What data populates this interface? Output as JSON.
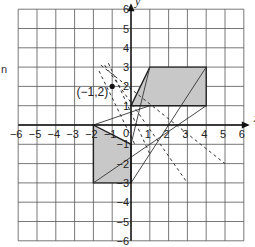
{
  "diagram": {
    "type": "coordinate-grid-transformation",
    "x_axis_label": "x",
    "y_axis_label": "y",
    "x_range": [
      -6,
      6
    ],
    "y_range": [
      -6,
      6
    ],
    "x_ticks": [
      "-6",
      "-5",
      "-4",
      "-3",
      "-2",
      "-1",
      "0",
      "1",
      "2",
      "3",
      "4",
      "5",
      "6"
    ],
    "y_ticks": [
      "6",
      "5",
      "4",
      "3",
      "2",
      "1",
      "-1",
      "-2",
      "-3",
      "-4",
      "-5",
      "-6"
    ],
    "origin_label": "0",
    "center_point": {
      "label": "(−1,2)",
      "x": -1,
      "y": 2
    },
    "shape_upper": {
      "name": "parallelogram",
      "vertices": [
        [
          0,
          1
        ],
        [
          1,
          3
        ],
        [
          4,
          3
        ],
        [
          4,
          1
        ]
      ],
      "fill": "#c8c8c8"
    },
    "shape_lower": {
      "name": "quadrilateral",
      "vertices": [
        [
          -2,
          0
        ],
        [
          0,
          -1
        ],
        [
          0,
          -3
        ],
        [
          -2,
          -3
        ]
      ],
      "fill": "#c8c8c8"
    },
    "solid_lines": [
      [
        [
          -2,
          0
        ],
        [
          1,
          1
        ]
      ],
      [
        [
          -2,
          -3
        ],
        [
          4,
          1
        ]
      ],
      [
        [
          0,
          -3
        ],
        [
          4,
          3
        ]
      ],
      [
        [
          0,
          -1
        ],
        [
          1,
          3
        ]
      ]
    ],
    "dashed_lines": [
      [
        [
          -1.6,
          3.1
        ],
        [
          5,
          -2
        ]
      ],
      [
        [
          -1.4,
          3.1
        ],
        [
          3,
          -3
        ]
      ],
      [
        [
          -1.2,
          3.2
        ],
        [
          1,
          -1.5
        ]
      ],
      [
        [
          -1.7,
          2.8
        ],
        [
          0.2,
          -1
        ]
      ]
    ],
    "edge_text": "n"
  }
}
